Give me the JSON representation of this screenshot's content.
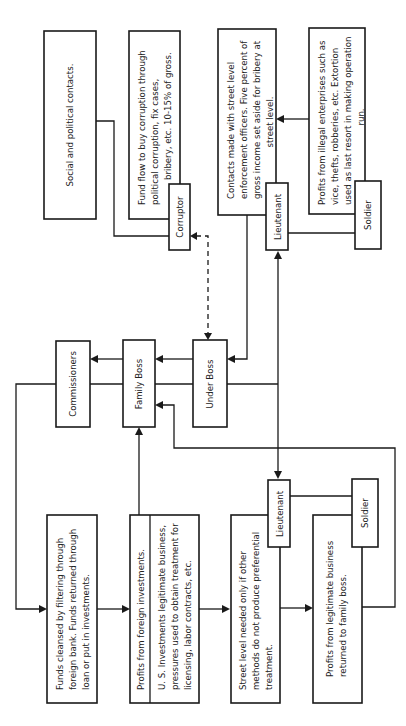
{
  "diagram": {
    "orientation": "rotated-90-ccw",
    "nodes": {
      "social": {
        "lines": [
          "Social and political contacts."
        ]
      },
      "fund_flow": {
        "lines": [
          "Fund flow to buy corruption through",
          "political corruption, fix cases,",
          "bribery, etc. 10-15% of gross."
        ]
      },
      "corruptor": {
        "label": "Corruptor"
      },
      "contacts": {
        "lines": [
          "Contacts made with street level",
          "enforcement officers. Five percent of",
          "gross income set aside for bribery at",
          "street level."
        ]
      },
      "lieutenant_top": {
        "label": "Lieutenant"
      },
      "profits_illegal": {
        "lines": [
          "Profits from illegal enterprises such as",
          "vice, thefts, robberies, etc. Extortion",
          "used as last resort in making operation",
          "run."
        ]
      },
      "soldier_top": {
        "label": "Soldier"
      },
      "commissioners": {
        "label": "Commissioners"
      },
      "family_boss": {
        "label": "Family Boss"
      },
      "under_boss": {
        "label": "Under Boss"
      },
      "funds_cleansed": {
        "lines": [
          "Funds cleansed by filtering through",
          "foreign bank. Funds returned through",
          "loan or put in investments."
        ]
      },
      "profits_foreign": {
        "lines": [
          "Profits from foreign investments."
        ]
      },
      "us_investments": {
        "lines": [
          "U. S. Investments legitimate business,",
          "pressures used to obtain treatment for",
          "licensing, labor contracts, etc."
        ]
      },
      "lieutenant_bottom": {
        "label": "Lieutenant"
      },
      "street_level": {
        "lines": [
          "Street level needed only if other",
          "methods do not produce preferential",
          "treatment."
        ]
      },
      "soldier_bottom": {
        "label": "Soldier"
      },
      "profits_legit": {
        "lines": [
          "Profits from legitimate business",
          "returned to family boss."
        ]
      }
    },
    "edges": [
      {
        "from": "social",
        "to": "corruptor",
        "style": "solid"
      },
      {
        "from": "corruptor",
        "to": "under_boss",
        "style": "dashed",
        "arrows": "both"
      },
      {
        "from": "profits_illegal",
        "to": "contacts",
        "style": "solid",
        "arrows": "end"
      },
      {
        "from": "contacts",
        "to": "under_boss",
        "style": "solid",
        "arrows": "end"
      },
      {
        "from": "lieutenant_top",
        "to": "soldier_top",
        "style": "solid"
      },
      {
        "from": "under_boss",
        "to": "family_boss",
        "style": "solid",
        "arrows": "end"
      },
      {
        "from": "family_boss",
        "to": "commissioners",
        "style": "solid",
        "arrows": "end"
      },
      {
        "from": "under_boss",
        "to": "lieutenant_top",
        "style": "solid",
        "arrows": "end"
      },
      {
        "from": "under_boss",
        "to": "lieutenant_bottom",
        "style": "solid",
        "arrows": "end"
      },
      {
        "from": "commissioners",
        "to": "funds_cleansed",
        "style": "solid",
        "arrows": "end"
      },
      {
        "from": "funds_cleansed",
        "to": "profits_foreign",
        "style": "solid",
        "arrows": "end"
      },
      {
        "from": "profits_foreign",
        "to": "family_boss",
        "style": "solid",
        "arrows": "end"
      },
      {
        "from": "us_investments",
        "to": "street_level",
        "style": "solid",
        "arrows": "end"
      },
      {
        "from": "street_level",
        "to": "profits_legit",
        "style": "solid",
        "arrows": "end"
      },
      {
        "from": "lieutenant_bottom",
        "to": "soldier_bottom",
        "style": "solid"
      },
      {
        "from": "profits_legit",
        "to": "family_boss",
        "style": "solid",
        "arrows": "end"
      }
    ]
  }
}
